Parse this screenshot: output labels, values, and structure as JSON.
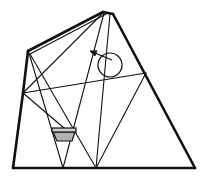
{
  "figure": {
    "background_color": "#ffffff",
    "stroke_color": "#111111",
    "basket_fill_color": "#b0b0b0",
    "basket_top_fill_color": "#cccccc",
    "canvas": {
      "width": 203,
      "height": 180
    },
    "points": {
      "apex_left": {
        "x": 103,
        "y": 12,
        "label": "apex-left"
      },
      "apex_right": {
        "x": 113,
        "y": 14,
        "label": "apex-right"
      },
      "shoulder_left": {
        "x": 28,
        "y": 51,
        "label": "left-shoulder"
      },
      "left_mid": {
        "x": 23,
        "y": 93,
        "label": "left-edge-mid-node"
      },
      "bottom_left": {
        "x": 13,
        "y": 168,
        "label": "bottom-left-corner"
      },
      "bottom_right": {
        "x": 195,
        "y": 168,
        "label": "bottom-right-corner"
      },
      "bottom_v1": {
        "x": 63,
        "y": 168,
        "label": "bottom-vertex-1"
      },
      "bottom_v2": {
        "x": 96,
        "y": 168,
        "label": "bottom-vertex-2"
      },
      "right_node": {
        "x": 146,
        "y": 73,
        "label": "right-edge-node"
      }
    },
    "outline_segments": [
      {
        "name": "top-left-edge",
        "x1": 28,
        "y1": 51,
        "x2": 103,
        "y2": 12
      },
      {
        "name": "apex-flat",
        "x1": 103,
        "y1": 12,
        "x2": 113,
        "y2": 14
      },
      {
        "name": "right-edge",
        "x1": 113,
        "y1": 14,
        "x2": 195,
        "y2": 168
      },
      {
        "name": "left-edge-upper",
        "x1": 28,
        "y1": 51,
        "x2": 23,
        "y2": 93
      },
      {
        "name": "left-edge-lower",
        "x1": 23,
        "y1": 93,
        "x2": 13,
        "y2": 168
      },
      {
        "name": "bottom-edge",
        "x1": 13,
        "y1": 168,
        "x2": 195,
        "y2": 168
      }
    ],
    "inner_segments": [
      {
        "name": "apex-to-bottom-v1",
        "x1": 104,
        "y1": 13,
        "x2": 63,
        "y2": 168
      },
      {
        "name": "apex-to-bottom-v2",
        "x1": 110,
        "y1": 14,
        "x2": 96,
        "y2": 168
      },
      {
        "name": "apex-to-left-mid",
        "x1": 103,
        "y1": 13,
        "x2": 23,
        "y2": 93
      },
      {
        "name": "apex-to-shoulder-inner",
        "x1": 108,
        "y1": 13,
        "x2": 30,
        "y2": 54
      },
      {
        "name": "shoulder-to-bottom-v1",
        "x1": 29,
        "y1": 53,
        "x2": 63,
        "y2": 168
      },
      {
        "name": "shoulder-to-bottom-v2",
        "x1": 30,
        "y1": 54,
        "x2": 96,
        "y2": 168
      },
      {
        "name": "left-mid-to-right-node",
        "x1": 23,
        "y1": 93,
        "x2": 146,
        "y2": 73
      },
      {
        "name": "left-mid-to-basket",
        "x1": 23,
        "y1": 93,
        "x2": 64,
        "y2": 128
      },
      {
        "name": "right-node-to-bottom-v2",
        "x1": 146,
        "y1": 73,
        "x2": 96,
        "y2": 168
      }
    ],
    "circle": {
      "name": "circle-annotation",
      "cx": 110,
      "cy": 65,
      "r": 12
    },
    "arrow": {
      "name": "arrow-annotation",
      "tail_x": 112,
      "tail_y": 60,
      "tip_x": 90,
      "tip_y": 51,
      "head_size": 7
    },
    "basket": {
      "name": "balloon-basket",
      "top_left_x": 53,
      "top_y": 128,
      "top_right_x": 75,
      "bottom_left_x": 57,
      "bottom_y": 141,
      "bottom_right_x": 72,
      "rim_height": 4
    }
  }
}
